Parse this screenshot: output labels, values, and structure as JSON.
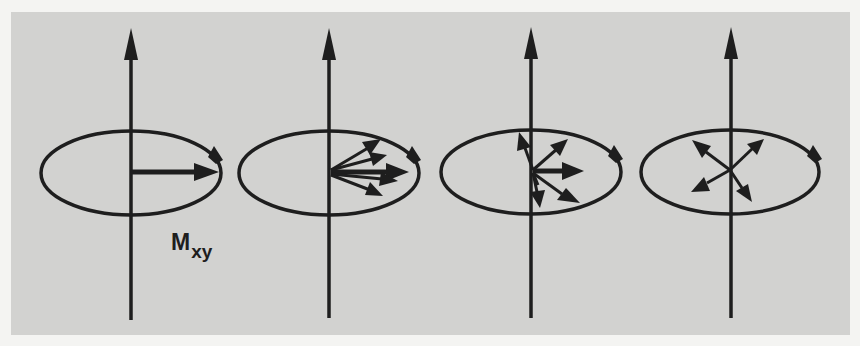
{
  "figure": {
    "colors": {
      "background": "#f4f4f2",
      "panel": "#d2d2d0",
      "ink": "#1e1e1e"
    },
    "label": {
      "main": "M",
      "subscript": "xy"
    },
    "stages": [
      {
        "name": "in-phase",
        "vector_angles_deg": [
          0
        ]
      },
      {
        "name": "starting-to-dephase",
        "vector_angles_deg": [
          28,
          14,
          2,
          -6,
          -22
        ]
      },
      {
        "name": "dephasing",
        "vector_angles_deg": [
          105,
          40,
          0,
          -35,
          -80,
          -100
        ]
      },
      {
        "name": "fully-dephased",
        "vector_angles_deg": [
          145,
          45,
          -140,
          -55
        ]
      }
    ]
  }
}
